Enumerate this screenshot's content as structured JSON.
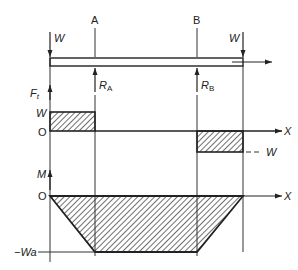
{
  "diagram": {
    "section_labels": {
      "A": "A",
      "B": "B"
    },
    "loads": {
      "left": "W",
      "right": "W"
    },
    "reactions": {
      "A": "R",
      "A_sub": "A",
      "B": "R",
      "B_sub": "B"
    },
    "shear": {
      "axis_label": "F",
      "axis_sub": "t",
      "upper_level": "W",
      "origin": "O",
      "x_axis": "X",
      "lower_level": "− W"
    },
    "moment": {
      "axis_label": "M",
      "origin": "O",
      "x_axis": "X",
      "min_level": "−Wa"
    }
  },
  "colors": {
    "ink": "#222222",
    "hatch": "#333333",
    "background": "#ffffff"
  }
}
